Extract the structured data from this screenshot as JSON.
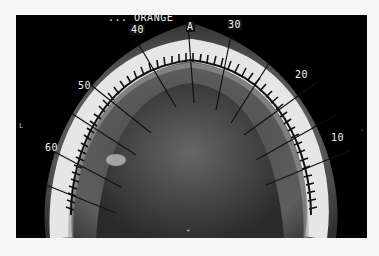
{
  "image": {
    "type": "axial CT scan of mandible with panoramic reconstruction curve",
    "header_label": "... ORANGE",
    "curve_labels": {
      "anterior": "A",
      "l40": "40",
      "l30": "30",
      "l50": "50",
      "l20": "20",
      "l60": "60",
      "l10": "10"
    },
    "side_markers": {
      "left": "L",
      "right": "-",
      "bottom": "•"
    },
    "colors": {
      "background": "#000000",
      "bone": "#e8e8e8",
      "soft_tissue": "#6a6a6a",
      "page": "#f6f6f6"
    }
  }
}
